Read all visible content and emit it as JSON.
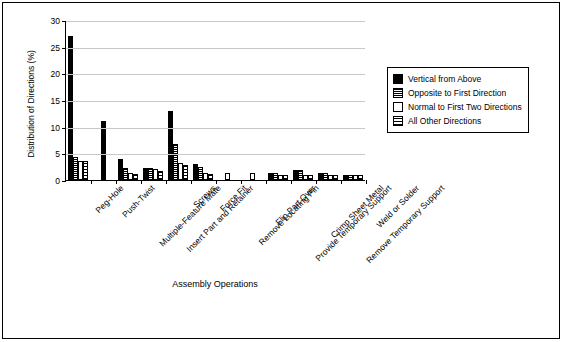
{
  "chart_data": {
    "type": "bar",
    "title": "",
    "xlabel": "Assembly Operations",
    "ylabel": "Distribution of Directions (%)",
    "ylim": [
      0,
      30
    ],
    "yticks": [
      0,
      5,
      10,
      15,
      20,
      25,
      30
    ],
    "grid": true,
    "legend_position": "right",
    "categories": [
      "Peg-Hole",
      "Push-Twist",
      "Multiple-Feature Mate",
      "Insert Part and Retainer",
      "Screws",
      "Force Fit",
      "Remove Locating Pin",
      "Flip Part Over",
      "Provide Temporary Support",
      "Crimp Sheet Metal",
      "Remove Temporary Support",
      "Weld or Solder"
    ],
    "series": [
      {
        "name": "Vertical from Above",
        "color": "#000000",
        "values": [
          27.0,
          11.0,
          4.0,
          2.2,
          13.0,
          3.0,
          0.0,
          0.0,
          1.3,
          1.8,
          1.3,
          1.0
        ]
      },
      {
        "name": "Opposite to First Direction",
        "color": "#555555",
        "values": [
          4.3,
          0.0,
          2.2,
          2.2,
          6.8,
          2.4,
          0.0,
          0.0,
          1.3,
          1.8,
          1.3,
          1.0
        ]
      },
      {
        "name": "Normal to First Two Directions",
        "color": "#ffffff",
        "values": [
          3.6,
          0.0,
          1.4,
          2.0,
          3.2,
          1.3,
          1.3,
          1.3,
          1.0,
          1.0,
          1.0,
          1.0
        ]
      },
      {
        "name": "All Other Directions",
        "color": "#dddddd",
        "values": [
          3.5,
          0.0,
          1.2,
          1.6,
          2.9,
          1.2,
          0.0,
          0.0,
          1.0,
          1.0,
          1.0,
          1.0
        ]
      }
    ]
  }
}
